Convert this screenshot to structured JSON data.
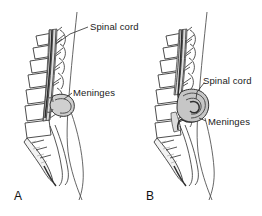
{
  "figure": {
    "background_color": "#ffffff",
    "line_color": "#3a3a3a",
    "sac_fill_color": "#cfcfcf",
    "canal_fill_color": "#dcdcdc",
    "text_color": "#1a1a1a"
  },
  "panels": [
    {
      "letter": "A",
      "name": "meningocele",
      "labels": [
        {
          "text": "Spinal cord",
          "x": 90,
          "y": 22
        },
        {
          "text": "Meninges",
          "x": 73,
          "y": 88
        }
      ]
    },
    {
      "letter": "B",
      "name": "myelomeningocele",
      "labels": [
        {
          "text": "Spinal cord",
          "x": 203,
          "y": 76
        },
        {
          "text": "Meninges",
          "x": 208,
          "y": 117
        }
      ]
    }
  ]
}
